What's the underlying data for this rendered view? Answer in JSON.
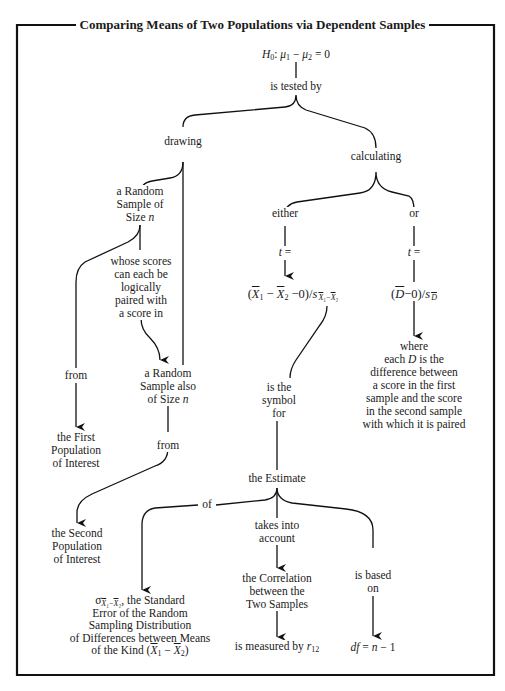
{
  "title": "Comparing Means of Two Populations via Dependent Samples",
  "nodes": {
    "h0": "H₀: μ₁ − μ₂ = 0",
    "is_tested_by": "is tested by",
    "drawing": "drawing",
    "calculating": "calculating",
    "random_sample": [
      "a Random",
      "Sample of",
      "Size n"
    ],
    "whose_scores": [
      "whose scores",
      "can each be",
      "logically",
      "paired with",
      "a score in"
    ],
    "from_1": "from",
    "random_sample_also": [
      "a Random",
      "Sample also",
      "of Size n"
    ],
    "from_2": "from",
    "first_population": [
      "the First",
      "Population",
      "of Interest"
    ],
    "second_population": [
      "the Second",
      "Population",
      "of Interest"
    ],
    "either": "either",
    "or": "or",
    "t_eq_1": "t =",
    "t_eq_2": "t =",
    "formula_xbar": "(X̄₁ − X̄₂ − 0)/s X̄₁−X̄₂",
    "formula_dbar": "(D̄ − 0)/s D̄",
    "where_d": [
      "where",
      "each D is the",
      "difference between",
      "a score in the first",
      "sample and the score",
      "in the second sample",
      "with which it is paired"
    ],
    "is_the_symbol_for": [
      "is the",
      "symbol",
      "for"
    ],
    "the_estimate": "the Estimate",
    "of": "of",
    "takes_into_account": [
      "takes into",
      "account"
    ],
    "the_correlation": [
      "the Correlation",
      "between the",
      "Two Samples"
    ],
    "is_measured_by": "is measured by r₁₂",
    "is_based_on": [
      "is based",
      "on"
    ],
    "df": "df = n − 1",
    "standard_error": [
      "σ X̄₁−X̄₂, the Standard",
      "Error of the Random",
      "Sampling Distribution",
      "of Differences between Means",
      "of the Kind (X̄₁ − X̄₂)"
    ]
  },
  "edges": [
    {
      "from": "h0",
      "to": "is_tested_by",
      "arrow": false
    },
    {
      "from": "is_tested_by",
      "to": "drawing",
      "arrow": false
    },
    {
      "from": "is_tested_by",
      "to": "calculating",
      "arrow": false
    },
    {
      "from": "drawing",
      "to": "random_sample",
      "arrow": false
    },
    {
      "from": "drawing",
      "to": "random_sample_also",
      "arrow": false
    },
    {
      "from": "random_sample",
      "to": "from_1",
      "arrow": false
    },
    {
      "from": "from_1",
      "to": "first_population",
      "arrow": true
    },
    {
      "from": "random_sample",
      "to": "whose_scores",
      "arrow": false
    },
    {
      "from": "whose_scores",
      "to": "random_sample_also",
      "arrow": true
    },
    {
      "from": "random_sample_also",
      "to": "from_2",
      "arrow": false
    },
    {
      "from": "from_2",
      "to": "second_population",
      "arrow": true
    },
    {
      "from": "calculating",
      "to": "either",
      "arrow": false
    },
    {
      "from": "calculating",
      "to": "or",
      "arrow": false
    },
    {
      "from": "either",
      "to": "t_eq_1",
      "arrow": false
    },
    {
      "from": "t_eq_1",
      "to": "formula_xbar",
      "arrow": true
    },
    {
      "from": "or",
      "to": "t_eq_2",
      "arrow": false
    },
    {
      "from": "t_eq_2",
      "to": "formula_dbar",
      "arrow": false
    },
    {
      "from": "formula_dbar",
      "to": "where_d",
      "arrow": true
    },
    {
      "from": "formula_xbar",
      "to": "is_the_symbol_for",
      "arrow": false
    },
    {
      "from": "is_the_symbol_for",
      "to": "the_estimate",
      "arrow": false
    },
    {
      "from": "the_estimate",
      "to": "of",
      "arrow": false
    },
    {
      "from": "of",
      "to": "standard_error",
      "arrow": true
    },
    {
      "from": "the_estimate",
      "to": "takes_into_account",
      "arrow": false
    },
    {
      "from": "takes_into_account",
      "to": "the_correlation",
      "arrow": true
    },
    {
      "from": "the_correlation",
      "to": "is_measured_by",
      "arrow": true
    },
    {
      "from": "the_estimate",
      "to": "is_based_on",
      "arrow": false
    },
    {
      "from": "is_based_on",
      "to": "df",
      "arrow": true
    }
  ]
}
